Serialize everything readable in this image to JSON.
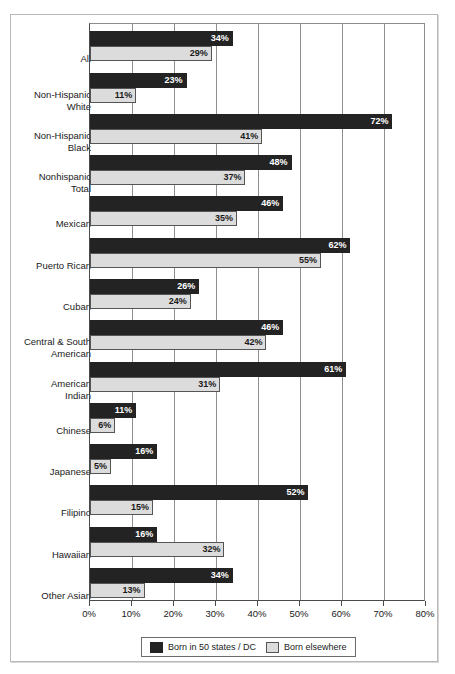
{
  "chart_data": {
    "type": "bar",
    "orientation": "horizontal",
    "title": "",
    "xlabel": "",
    "ylabel": "",
    "xlim": [
      0,
      80
    ],
    "xunit": "%",
    "grid": true,
    "legend_position": "bottom",
    "xticks": [
      0,
      10,
      20,
      30,
      40,
      50,
      60,
      70,
      80
    ],
    "xtick_labels": [
      "0%",
      "10%",
      "20%",
      "30%",
      "40%",
      "50%",
      "60%",
      "70%",
      "80%"
    ],
    "categories": [
      "All",
      "Non-Hispanic White",
      "Non-Hispanic Black",
      "Nonhispanic Total",
      "Mexican",
      "Puerto Rican",
      "Cuban",
      "Central & South American",
      "American Indian",
      "Chinese",
      "Japanese",
      "Filipino",
      "Hawaiian",
      "Other Asian"
    ],
    "category_lines": [
      [
        "All"
      ],
      [
        "Non-Hispanic",
        "White"
      ],
      [
        "Non-Hispanic",
        "Black"
      ],
      [
        "Nonhispanic",
        "Total"
      ],
      [
        "Mexican"
      ],
      [
        "Puerto Rican"
      ],
      [
        "Cuban"
      ],
      [
        "Central & South",
        "American"
      ],
      [
        "American",
        "Indian"
      ],
      [
        "Chinese"
      ],
      [
        "Japanese"
      ],
      [
        "Filipino"
      ],
      [
        "Hawaiian"
      ],
      [
        "Other Asian"
      ]
    ],
    "series": [
      {
        "name": "Born in 50 states / DC",
        "color": "#232323",
        "values": [
          34,
          23,
          72,
          48,
          46,
          62,
          26,
          46,
          61,
          11,
          16,
          52,
          16,
          34
        ],
        "labels": [
          "34%",
          "23%",
          "72%",
          "48%",
          "46%",
          "62%",
          "26%",
          "46%",
          "61%",
          "11%",
          "16%",
          "52%",
          "16%",
          "34%"
        ]
      },
      {
        "name": "Born elsewhere",
        "color": "#dcdcdc",
        "values": [
          29,
          11,
          41,
          37,
          35,
          55,
          24,
          42,
          31,
          6,
          5,
          15,
          32,
          13
        ],
        "labels": [
          "29%",
          "11%",
          "41%",
          "37%",
          "35%",
          "55%",
          "24%",
          "42%",
          "31%",
          "6%",
          "5%",
          "15%",
          "32%",
          "13%"
        ]
      }
    ]
  },
  "legend": {
    "items": [
      {
        "label": "Born in 50 states / DC",
        "swatch": "dark"
      },
      {
        "label": "Born elsewhere",
        "swatch": "light"
      }
    ]
  }
}
